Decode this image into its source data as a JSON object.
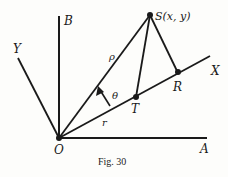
{
  "figure": {
    "caption": "Fig. 30",
    "points": {
      "O": {
        "label": "O",
        "x": 59,
        "y": 138
      },
      "S": {
        "label": "S(x, y)",
        "x": 150,
        "y": 15
      },
      "T": {
        "label": "T",
        "x": 136,
        "y": 97
      },
      "R": {
        "label": "R",
        "x": 178,
        "y": 73
      }
    },
    "axes": {
      "A": {
        "label": "A"
      },
      "B": {
        "label": "B"
      },
      "X": {
        "label": "X"
      },
      "Y": {
        "label": "Y"
      }
    },
    "segments": {
      "rho": {
        "label": "ρ"
      },
      "r": {
        "label": "r"
      },
      "theta": {
        "label": "θ"
      }
    },
    "colors": {
      "ink": "#1a1a1a",
      "paper": "#fdfdfb"
    }
  }
}
